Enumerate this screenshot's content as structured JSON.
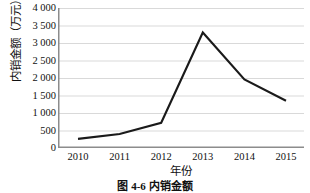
{
  "chart_data": {
    "type": "line",
    "title": "",
    "xlabel": "年份",
    "ylabel": "内销金额（万元）",
    "categories": [
      "2010",
      "2011",
      "2012",
      "2013",
      "2014",
      "2015"
    ],
    "values": [
      260,
      400,
      720,
      3300,
      1960,
      1350
    ],
    "series": [
      {
        "name": "内销金额",
        "values": [
          260,
          400,
          720,
          3300,
          1960,
          1350
        ]
      }
    ],
    "ylim": [
      0,
      4000
    ],
    "ytick_labels": [
      "4 000",
      "3 500",
      "3 000",
      "2 500",
      "2 000",
      "1 500",
      "1 000",
      "500",
      "0"
    ],
    "ytick_values": [
      4000,
      3500,
      3000,
      2500,
      2000,
      1500,
      1000,
      500,
      0
    ],
    "grid": "horizontal",
    "legend": "none",
    "line_color": "#1a1a1a",
    "grid_color": "#d9d9d9",
    "axis_color": "#808080"
  },
  "caption": {
    "text": "图 4-6  内销金额"
  }
}
